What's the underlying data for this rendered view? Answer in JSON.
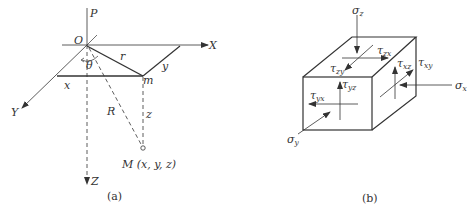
{
  "panel_a": {
    "caption": "(a)",
    "labels": {
      "P": "P",
      "O": "O",
      "X": "X",
      "Y": "Y",
      "Z": "Z",
      "r": "r",
      "theta": "θ",
      "x": "x",
      "y": "y",
      "m": "m",
      "R": "R",
      "z": "z",
      "M": "M (x, y, z)"
    }
  },
  "panel_b": {
    "caption": "(b)",
    "labels": {
      "sigma_z": "σ",
      "sigma_z_sub": "z",
      "sigma_x": "σ",
      "sigma_x_sub": "x",
      "sigma_y": "σ",
      "sigma_y_sub": "y",
      "tau_zx": "τ",
      "tau_zx_sub": "zx",
      "tau_zy": "τ",
      "tau_zy_sub": "zy",
      "tau_xz": "τ",
      "tau_xz_sub": "xz",
      "tau_xy": "τ",
      "tau_xy_sub": "xy",
      "tau_yz": "τ",
      "tau_yz_sub": "yz",
      "tau_yx": "τ",
      "tau_yx_sub": "yx"
    }
  }
}
